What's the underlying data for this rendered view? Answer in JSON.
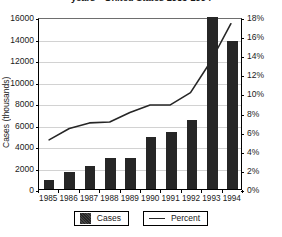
{
  "chart_data": {
    "type": "bar",
    "title_visible_line1": "",
    "title_visible_line2": "years—United States 1985-1994",
    "categories": [
      "1985",
      "1986",
      "1987",
      "1988",
      "1989",
      "1990",
      "1991",
      "1992",
      "1993",
      "1994"
    ],
    "xlabel": "",
    "ylabel": "Cases (thousands)",
    "ylabel_right": "",
    "ylim": [
      0,
      16000
    ],
    "ylim_right": [
      0,
      18
    ],
    "yticks": [
      0,
      2000,
      4000,
      6000,
      8000,
      10000,
      12000,
      14000,
      16000
    ],
    "ytick_labels": [
      "0",
      "2000",
      "4000",
      "6000",
      "8000",
      "10000",
      "12000",
      "14000",
      "16000"
    ],
    "yticks_right": [
      0,
      2,
      4,
      6,
      8,
      10,
      12,
      14,
      16,
      18
    ],
    "ytick_labels_right": [
      "0%",
      "2%",
      "4%",
      "6%",
      "8%",
      "10%",
      "12%",
      "14%",
      "16%",
      "18%"
    ],
    "grid": true,
    "legend_position": "bottom",
    "series": [
      {
        "name": "Cases",
        "type": "bar",
        "axis": "left",
        "color": "#262626",
        "values": [
          800,
          1600,
          2100,
          2900,
          2900,
          4800,
          5300,
          6400,
          16000,
          13800
        ]
      },
      {
        "name": "Percent",
        "type": "line",
        "axis": "right",
        "color": "#262626",
        "values": [
          5.2,
          6.4,
          7.0,
          7.1,
          8.1,
          8.9,
          8.9,
          10.2,
          13.5,
          17.5
        ]
      }
    ]
  },
  "legend": {
    "items": [
      {
        "label": "Cases",
        "marker": "filled-square-swatch"
      },
      {
        "label": "Percent",
        "marker": "line-swatch"
      }
    ]
  }
}
